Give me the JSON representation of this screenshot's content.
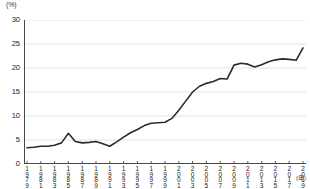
{
  "chart_data": {
    "type": "line",
    "title": "",
    "subtitle": "",
    "xlabel": "年",
    "ylabel": "(%)",
    "unit_label": "(%)",
    "axis_suffix": "(年)",
    "grid": true,
    "legend": "none",
    "xlim": [
      1979,
      2019
    ],
    "ylim": [
      0,
      30
    ],
    "yticks": [
      0,
      5,
      10,
      15,
      20,
      25,
      30
    ],
    "ytick_labels": [
      "0",
      "5",
      "10",
      "15",
      "20",
      "25",
      "30"
    ],
    "xtick_labels": [
      "1979",
      "1981",
      "1983",
      "1985",
      "1987",
      "1989",
      "1991",
      "1993",
      "1995",
      "1997",
      "1999",
      "2001",
      "2003",
      "2005",
      "2007",
      "2009",
      "2011",
      "2013",
      "2015",
      "2017",
      "2019"
    ],
    "x": [
      1979,
      1980,
      1981,
      1982,
      1983,
      1984,
      1985,
      1986,
      1987,
      1988,
      1989,
      1990,
      1991,
      1992,
      1993,
      1994,
      1995,
      1996,
      1997,
      1998,
      1999,
      2000,
      2001,
      2002,
      2003,
      2004,
      2005,
      2006,
      2007,
      2008,
      2009,
      2010,
      2011,
      2012,
      2013,
      2014,
      2015,
      2016,
      2017,
      2018,
      2019
    ],
    "values": [
      3.4,
      3.5,
      3.7,
      3.7,
      3.9,
      4.4,
      6.4,
      4.7,
      4.4,
      4.5,
      4.7,
      4.2,
      3.7,
      4.6,
      5.6,
      6.5,
      7.2,
      8.0,
      8.5,
      8.6,
      8.7,
      9.5,
      11.2,
      13.1,
      15.0,
      16.2,
      16.8,
      17.2,
      17.8,
      17.7,
      20.6,
      21.0,
      20.8,
      20.2,
      20.7,
      21.3,
      21.7,
      21.9,
      21.8,
      21.6,
      24.2
    ],
    "series": [
      {
        "name": "series-1",
        "color": "#2b2b2b",
        "values": [
          3.4,
          3.5,
          3.7,
          3.7,
          3.9,
          4.4,
          6.4,
          4.7,
          4.4,
          4.5,
          4.7,
          4.2,
          3.7,
          4.6,
          5.6,
          6.5,
          7.2,
          8.0,
          8.5,
          8.6,
          8.7,
          9.5,
          11.2,
          13.1,
          15.0,
          16.2,
          16.8,
          17.2,
          17.8,
          17.7,
          20.6,
          21.0,
          20.8,
          20.2,
          20.7,
          21.3,
          21.7,
          21.9,
          21.8,
          21.6,
          24.2
        ]
      }
    ],
    "colors": {
      "line": "#2b2b2b",
      "grid": "#e2e2e2",
      "axis": "#4a4a4a",
      "text": "#222222",
      "background": "#ffffff"
    }
  }
}
